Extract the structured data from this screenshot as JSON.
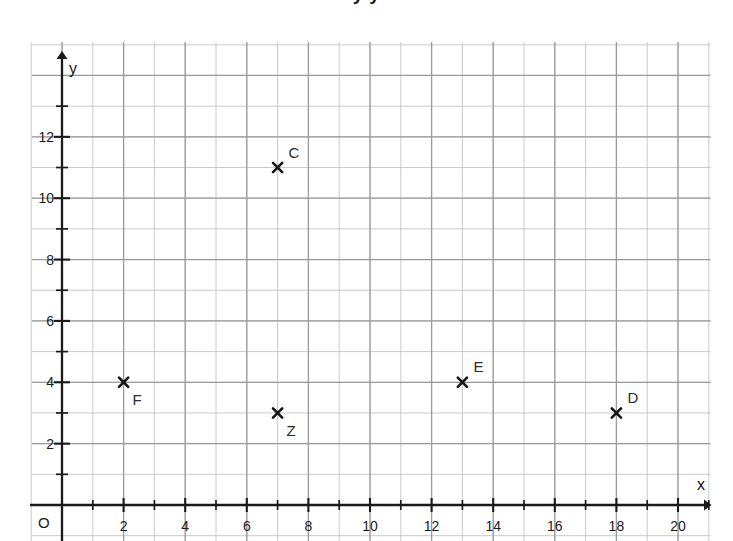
{
  "figure": {
    "title_clipped": "y    y",
    "background_color": "#ffffff",
    "grid_color": "#9a9a9a",
    "minor_grid_color": "#bdbdbd",
    "axis_color": "#1a1a1a",
    "marker_color": "#151515",
    "label_color": "#2a2a2a"
  },
  "origin_label": "O",
  "chart_data": {
    "type": "scatter",
    "title": "",
    "xlabel": "x",
    "ylabel": "y",
    "xlim": [
      -1,
      21.5
    ],
    "ylim": [
      -1.2,
      15
    ],
    "grid": true,
    "minor_grid": true,
    "legend": "none",
    "x_ticks": [
      2,
      4,
      6,
      8,
      10,
      12,
      14,
      16,
      18,
      20
    ],
    "x_tick_labels": [
      "2",
      "4",
      "6",
      "8",
      "10",
      "12",
      "14",
      "16",
      "18",
      "20"
    ],
    "y_ticks": [
      2,
      4,
      6,
      8,
      10,
      12
    ],
    "y_tick_labels": [
      "2",
      "4",
      "6",
      "8",
      "10",
      "12"
    ],
    "points": [
      {
        "label": "C",
        "x": 7,
        "y": 11,
        "label_pos": "above-right"
      },
      {
        "label": "F",
        "x": 2,
        "y": 4,
        "label_pos": "below-right"
      },
      {
        "label": "Z",
        "x": 7,
        "y": 3,
        "label_pos": "below-right"
      },
      {
        "label": "E",
        "x": 13,
        "y": 4,
        "label_pos": "above-right"
      },
      {
        "label": "D",
        "x": 18,
        "y": 3,
        "label_pos": "above-right"
      }
    ]
  }
}
